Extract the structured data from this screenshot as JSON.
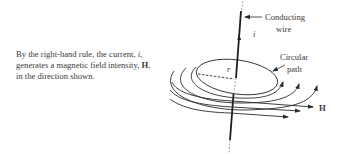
{
  "caption": {
    "part1": "By the right-hand rule, the current, ",
    "current_symbol": "i",
    "part2": ", generates a magnetic field intensity, ",
    "field_symbol": "H",
    "part3": ", in the direction shown."
  },
  "diagram": {
    "labels": {
      "wire_line1": "Conducting",
      "wire_line2": "wire",
      "current": "i",
      "radius": "r",
      "path_line1": "Circular",
      "path_line2": "path",
      "field": "H"
    },
    "colors": {
      "stroke": "#2a2a2a",
      "text": "#3a3a3a"
    }
  }
}
